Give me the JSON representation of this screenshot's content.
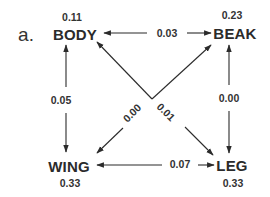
{
  "figure": {
    "panel_label": "a.",
    "nodes": {
      "body": {
        "name": "BODY",
        "value": "0.11"
      },
      "beak": {
        "name": "BEAK",
        "value": "0.23"
      },
      "wing": {
        "name": "WING",
        "value": "0.33"
      },
      "leg": {
        "name": "LEG",
        "value": "0.33"
      }
    },
    "edges": {
      "body_beak": {
        "from": "BODY",
        "to": "BEAK",
        "value": "0.03",
        "direction": "bidirectional"
      },
      "body_wing": {
        "from": "BODY",
        "to": "WING",
        "value": "0.05",
        "direction": "bidirectional"
      },
      "beak_leg": {
        "from": "BEAK",
        "to": "LEG",
        "value": "0.00",
        "direction": "bidirectional"
      },
      "wing_leg": {
        "from": "WING",
        "to": "LEG",
        "value": "0.07",
        "direction": "bidirectional"
      },
      "wing_beak": {
        "from": "WING",
        "to": "BEAK",
        "value": "0.00",
        "direction": "bidirectional"
      },
      "body_leg": {
        "from": "BODY",
        "to": "LEG",
        "value": "0.01",
        "direction": "bidirectional"
      }
    },
    "colors": {
      "ink": "#2b2b2b",
      "background": "#ffffff"
    }
  }
}
